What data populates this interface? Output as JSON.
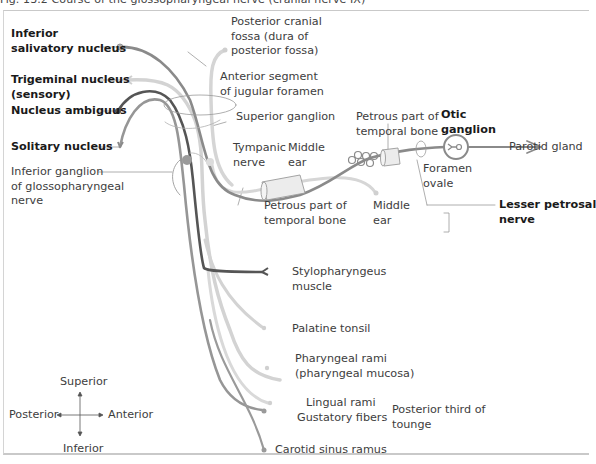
{
  "caption": "Fig. 13.2   Course of the glossopharyngeal nerve (cranial nerve IX)",
  "colors": {
    "motor_dark": "#5a5a5a",
    "parasympathetic": "#8c8c8c",
    "sensory_light": "#cfcfcf",
    "gustatory": "#9a9a9a",
    "frame": "#c9c9c9"
  },
  "nuclei": {
    "inferior_salivatory": [
      "Inferior",
      "salivatory nucleus"
    ],
    "trigeminal": [
      "Trigeminal nucleus",
      "(sensory)"
    ],
    "ambiguus": "Nucleus ambiguus",
    "solitary": "Solitary nucleus"
  },
  "labels": {
    "inferior_ganglion": [
      "Inferior ganglion",
      "of glossopharyngeal",
      "nerve"
    ],
    "posterior_cranial_fossa": [
      "Posterior cranial",
      "fossa (dura of",
      "posterior fossa)"
    ],
    "anterior_segment": [
      "Anterior segment",
      "of jugular foramen"
    ],
    "superior_ganglion": "Superior ganglion",
    "tympanic_nerve": [
      "Tympanic",
      "nerve"
    ],
    "middle_ear_upper": [
      "Middle",
      "ear"
    ],
    "petrous_upper": [
      "Petrous part of",
      "temporal bone"
    ],
    "otic_ganglion": [
      "Otic",
      "ganglion"
    ],
    "parotid_gland": "Parotid gland",
    "foramen_ovale": [
      "Foramen",
      "ovale"
    ],
    "lesser_petrosal": [
      "Lesser petrosal",
      "nerve"
    ],
    "petrous_lower": [
      "Petrous part of",
      "temporal bone"
    ],
    "middle_ear_lower": [
      "Middle",
      "ear"
    ],
    "stylopharyngeus": [
      "Stylopharyngeus",
      "muscle"
    ],
    "palatine_tonsil": "Palatine tonsil",
    "pharyngeal_rami": [
      "Pharyngeal rami",
      "(pharyngeal mucosa)"
    ],
    "lingual_rami": "Lingual rami",
    "gustatory_fibers": "Gustatory fibers",
    "posterior_third": [
      "Posterior third of",
      "tounge"
    ],
    "carotid_sinus": "Carotid sinus ramus"
  },
  "compass": {
    "superior": "Superior",
    "inferior": "Inferior",
    "posterior": "Posterior",
    "anterior": "Anterior"
  }
}
